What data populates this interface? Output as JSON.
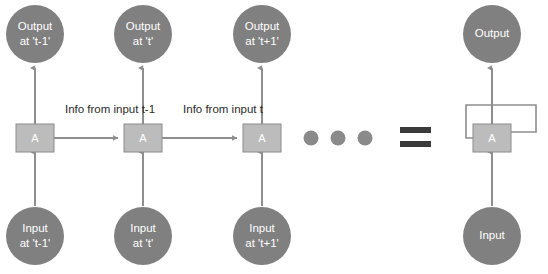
{
  "diagram": {
    "colors": {
      "circle_fill": "#808080",
      "cell_fill": "#bcbcbc",
      "cell_stroke": "#8c8c8c",
      "connector": "#8e8e8e",
      "circle_text": "#ffffff",
      "edge_text": "#2b2b2b",
      "equals": "#3a3a3a",
      "dot": "#8a8a8a",
      "background": "#ffffff"
    },
    "unrolled": {
      "timesteps": [
        {
          "id": "t-minus-1",
          "output_line_1": "Output",
          "output_line_2": "at 't-1'",
          "cell_label": "A",
          "input_line_1": "Input",
          "input_line_2": "at 't-1'"
        },
        {
          "id": "t",
          "output_line_1": "Output",
          "output_line_2": "at 't'",
          "cell_label": "A",
          "input_line_1": "Input",
          "input_line_2": "at 't'"
        },
        {
          "id": "t-plus-1",
          "output_line_1": "Output",
          "output_line_2": "at 't+1'",
          "cell_label": "A",
          "input_line_1": "Input",
          "input_line_2": "at 't+1'"
        }
      ],
      "recurrent_edge_labels": [
        "Info from input t-1",
        "Info from input t"
      ],
      "ellipsis_dot_count": 3
    },
    "equals_symbol": "=",
    "folded": {
      "output_label": "Output",
      "cell_label": "A",
      "input_label": "Input",
      "has_self_loop": true
    }
  }
}
